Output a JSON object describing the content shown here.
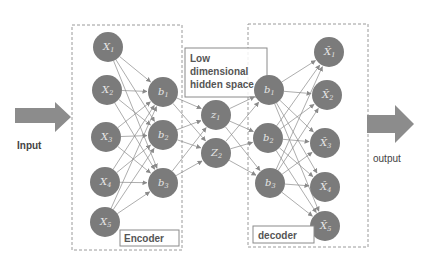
{
  "diagram": {
    "colors": {
      "node_fill": "#7b7b7b",
      "node_text": "#e6e6e6",
      "edge": "#8a8a8a",
      "arrow_fill": "#8c8c8c",
      "dashed_border": "#9a9a9a",
      "label_box_border": "#8a8a8a",
      "text": "#555555"
    },
    "input_label": "Input",
    "output_label": "output",
    "encoder_label": "Encoder",
    "decoder_label": "decoder",
    "hidden_space_label": [
      "Low",
      "dimensional",
      "hidden space"
    ],
    "layers": {
      "input": [
        {
          "id": "x1",
          "base": "X",
          "sub": "1",
          "x": 108,
          "y": 47
        },
        {
          "id": "x2",
          "base": "X",
          "sub": "2",
          "x": 107,
          "y": 90
        },
        {
          "id": "x3",
          "base": "X",
          "sub": "3",
          "x": 106,
          "y": 137
        },
        {
          "id": "x4",
          "base": "X",
          "sub": "4",
          "x": 105,
          "y": 182
        },
        {
          "id": "x5",
          "base": "X",
          "sub": "5",
          "x": 105,
          "y": 222
        }
      ],
      "encoder_hidden": [
        {
          "id": "eb1",
          "base": "b",
          "sub": "1",
          "x": 163,
          "y": 92
        },
        {
          "id": "eb2",
          "base": "b",
          "sub": "2",
          "x": 163,
          "y": 135
        },
        {
          "id": "eb3",
          "base": "b",
          "sub": "3",
          "x": 163,
          "y": 183
        }
      ],
      "latent": [
        {
          "id": "z1",
          "base": "z",
          "sub": "1",
          "x": 216,
          "y": 115
        },
        {
          "id": "z2",
          "base": "Z",
          "sub": "2",
          "x": 216,
          "y": 153
        }
      ],
      "decoder_hidden": [
        {
          "id": "db1",
          "base": "b",
          "sub": "1",
          "x": 269,
          "y": 90
        },
        {
          "id": "db2",
          "base": "b",
          "sub": "2",
          "x": 268,
          "y": 138
        },
        {
          "id": "db3",
          "base": "b",
          "sub": "3",
          "x": 270,
          "y": 183
        }
      ],
      "output": [
        {
          "id": "y1",
          "base": "X̂",
          "sub": "1",
          "x": 329,
          "y": 52
        },
        {
          "id": "y2",
          "base": "X̂",
          "sub": "2",
          "x": 327,
          "y": 95
        },
        {
          "id": "y3",
          "base": "X̂",
          "sub": "3",
          "x": 325,
          "y": 143
        },
        {
          "id": "y4",
          "base": "X̂",
          "sub": "4",
          "x": 325,
          "y": 187
        },
        {
          "id": "y5",
          "base": "X̂",
          "sub": "5",
          "x": 325,
          "y": 226
        }
      ]
    },
    "connections": [
      [
        "input",
        "encoder_hidden"
      ],
      [
        "encoder_hidden",
        "latent"
      ],
      [
        "latent",
        "decoder_hidden"
      ],
      [
        "decoder_hidden",
        "output"
      ]
    ],
    "node_radius": 15
  }
}
